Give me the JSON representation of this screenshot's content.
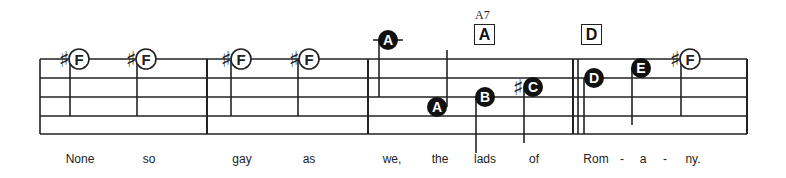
{
  "staff": {
    "lines": 5,
    "start_x": 40,
    "end_x": 747,
    "line_ys": [
      59,
      78,
      97,
      116,
      134
    ],
    "color": "#222222"
  },
  "chords": [
    {
      "name": "A7",
      "box_label": "A",
      "x": 474
    },
    {
      "name": "",
      "box_label": "D",
      "x": 581
    }
  ],
  "notes": [
    {
      "label": "F",
      "sharp": true,
      "filled": false,
      "x": 79,
      "y": 59
    },
    {
      "label": "F",
      "sharp": true,
      "filled": false,
      "x": 146,
      "y": 59
    },
    {
      "label": "F",
      "sharp": true,
      "filled": false,
      "x": 241,
      "y": 59
    },
    {
      "label": "F",
      "sharp": true,
      "filled": false,
      "x": 309,
      "y": 59
    },
    {
      "label": "A",
      "sharp": false,
      "filled": true,
      "x": 388,
      "y": 40
    },
    {
      "label": "A",
      "sharp": false,
      "filled": true,
      "x": 437,
      "y": 107
    },
    {
      "label": "B",
      "sharp": false,
      "filled": true,
      "x": 485,
      "y": 97
    },
    {
      "label": "C",
      "sharp": true,
      "filled": true,
      "x": 533,
      "y": 87
    },
    {
      "label": "D",
      "sharp": false,
      "filled": true,
      "x": 594,
      "y": 78
    },
    {
      "label": "E",
      "sharp": false,
      "filled": true,
      "x": 641,
      "y": 68
    },
    {
      "label": "F",
      "sharp": true,
      "filled": false,
      "x": 690,
      "y": 59
    }
  ],
  "lyrics": [
    {
      "text": "None",
      "x": 80
    },
    {
      "text": "so",
      "x": 149
    },
    {
      "text": "gay",
      "x": 242
    },
    {
      "text": "as",
      "x": 309
    },
    {
      "text": "we,",
      "x": 392
    },
    {
      "text": "the",
      "x": 440
    },
    {
      "text": "lads",
      "x": 485
    },
    {
      "text": "of",
      "x": 534
    },
    {
      "text": "Rom",
      "x": 596
    },
    {
      "text": "-",
      "x": 622
    },
    {
      "text": "a",
      "x": 643
    },
    {
      "text": "-",
      "x": 665
    },
    {
      "text": "ny.",
      "x": 693
    }
  ]
}
